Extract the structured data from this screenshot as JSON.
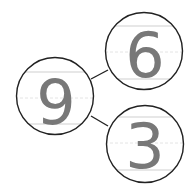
{
  "diagram": {
    "type": "number-bond",
    "whole": "9",
    "parts": [
      "6",
      "3"
    ],
    "colors": {
      "circle_stroke": "#222222",
      "connector": "#222222",
      "digit": "#787878",
      "guide_line": "#cfcfcf",
      "guide_dash": "#e4e4e4",
      "background": "#ffffff"
    }
  }
}
